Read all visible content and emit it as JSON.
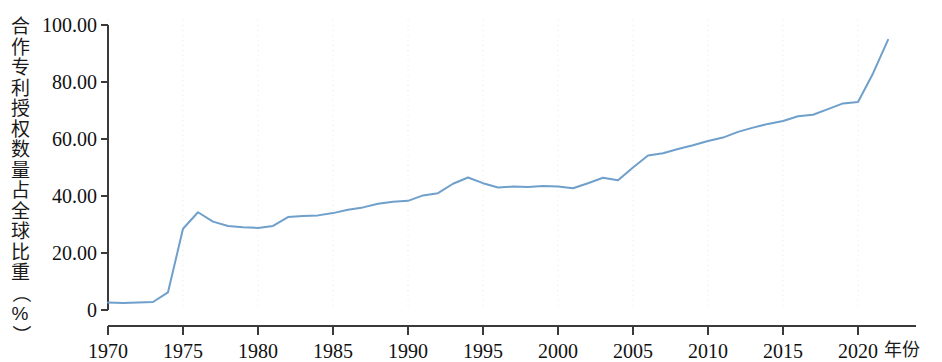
{
  "chart_data": {
    "type": "line",
    "title": "",
    "subtitle": "",
    "xlabel": "年份",
    "ylabel": "合作专利授权数量占全球比重（%）",
    "ylabel_chars": [
      "合",
      "作",
      "专",
      "利",
      "授",
      "权",
      "数",
      "量",
      "占",
      "全",
      "球",
      "比",
      "重",
      "（",
      "%",
      "）"
    ],
    "xlim": [
      1969,
      2023
    ],
    "ylim": [
      0,
      100
    ],
    "grid": "vertical dotted gridlines at 5-year ticks",
    "legend": "none",
    "y_ticks": [
      0,
      20,
      40,
      60,
      80,
      100
    ],
    "y_tick_labels": [
      "0",
      "20.00",
      "40.00",
      "60.00",
      "80.00",
      "100.00"
    ],
    "x_ticks": [
      1970,
      1975,
      1980,
      1985,
      1990,
      1995,
      2000,
      2005,
      2010,
      2015,
      2020
    ],
    "x_tick_labels": [
      "1970",
      "1975",
      "1980",
      "1985",
      "1990",
      "1995",
      "2000",
      "2005",
      "2010",
      "2015",
      "2020"
    ],
    "series": [
      {
        "name": "合作专利授权数量占全球比重",
        "color": "#6f9fcb",
        "x": [
          1970,
          1971,
          1972,
          1973,
          1974,
          1975,
          1976,
          1977,
          1978,
          1979,
          1980,
          1981,
          1982,
          1983,
          1984,
          1985,
          1986,
          1987,
          1988,
          1989,
          1990,
          1991,
          1992,
          1993,
          1994,
          1995,
          1996,
          1997,
          1998,
          1999,
          2000,
          2001,
          2002,
          2003,
          2004,
          2005,
          2006,
          2007,
          2008,
          2009,
          2010,
          2011,
          2012,
          2013,
          2014,
          2015,
          2016,
          2017,
          2018,
          2019,
          2020,
          2021,
          2022
        ],
        "values": [
          2.6,
          2.5,
          2.6,
          2.8,
          6.2,
          28.5,
          34.3,
          31.0,
          29.5,
          29.0,
          28.8,
          29.5,
          32.6,
          33.0,
          33.2,
          34.0,
          35.2,
          36.0,
          37.3,
          38.0,
          38.3,
          40.2,
          41.0,
          44.3,
          46.5,
          44.5,
          43.0,
          43.3,
          43.2,
          43.5,
          43.3,
          42.7,
          44.5,
          46.4,
          45.5,
          50.0,
          54.2,
          55.0,
          56.5,
          57.8,
          59.3,
          60.5,
          62.5,
          64.0,
          65.3,
          66.3,
          68.0,
          68.5,
          70.5,
          72.5,
          73.0,
          83.0,
          94.8
        ]
      }
    ]
  },
  "axes": {
    "y_axis_name": "y-axis",
    "x_axis_name": "x-axis"
  }
}
